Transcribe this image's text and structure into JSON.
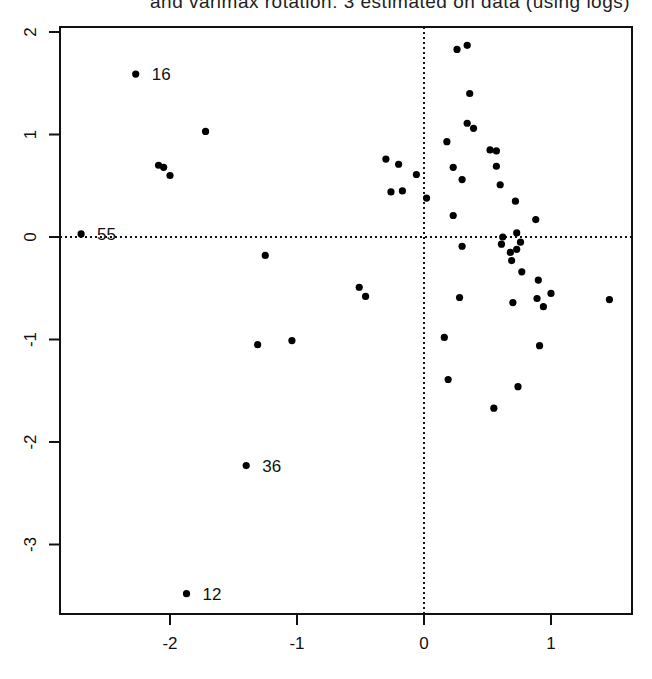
{
  "caption": "and varimax rotation: 3 estimated on data (using logs)",
  "chart_data": {
    "type": "scatter",
    "title": "and varimax rotation: 3 estimated on data (using logs)",
    "xlabel": "",
    "ylabel": "",
    "xlim": [
      -2.8,
      1.64
    ],
    "ylim": [
      -3.68,
      2.05
    ],
    "grid": false,
    "reference_lines": {
      "x": 0,
      "y": 0,
      "style": "dotted"
    },
    "x_ticks": [
      -2,
      -1,
      0,
      1
    ],
    "x_tick_labels": [
      "-2",
      "-1",
      "0",
      "1"
    ],
    "y_ticks": [
      2,
      1,
      0,
      -1,
      -2,
      -3
    ],
    "y_tick_labels": [
      "2",
      "1",
      "0",
      "-1",
      "-2",
      "-3"
    ],
    "labeled_points": [
      {
        "label": "16",
        "x": -2.27,
        "y": 1.59
      },
      {
        "label": "55",
        "x": -2.7,
        "y": 0.03
      },
      {
        "label": "36",
        "x": -1.4,
        "y": -2.23
      },
      {
        "label": "12",
        "x": -1.87,
        "y": -3.48
      }
    ],
    "points": [
      {
        "x": -2.27,
        "y": 1.59
      },
      {
        "x": -1.72,
        "y": 1.03
      },
      {
        "x": -2.09,
        "y": 0.7
      },
      {
        "x": -2.05,
        "y": 0.68
      },
      {
        "x": -2.0,
        "y": 0.6
      },
      {
        "x": -2.7,
        "y": 0.03
      },
      {
        "x": -1.25,
        "y": -0.18
      },
      {
        "x": -0.51,
        "y": -0.49
      },
      {
        "x": -0.46,
        "y": -0.58
      },
      {
        "x": -1.31,
        "y": -1.05
      },
      {
        "x": -1.04,
        "y": -1.01
      },
      {
        "x": -1.4,
        "y": -2.23
      },
      {
        "x": -1.87,
        "y": -3.48
      },
      {
        "x": -0.3,
        "y": 0.76
      },
      {
        "x": -0.2,
        "y": 0.71
      },
      {
        "x": -0.06,
        "y": 0.61
      },
      {
        "x": -0.26,
        "y": 0.44
      },
      {
        "x": -0.17,
        "y": 0.45
      },
      {
        "x": 0.02,
        "y": 0.38
      },
      {
        "x": 0.26,
        "y": 1.83
      },
      {
        "x": 0.34,
        "y": 1.87
      },
      {
        "x": 0.36,
        "y": 1.4
      },
      {
        "x": 0.34,
        "y": 1.11
      },
      {
        "x": 0.39,
        "y": 1.06
      },
      {
        "x": 0.18,
        "y": 0.93
      },
      {
        "x": 0.52,
        "y": 0.85
      },
      {
        "x": 0.57,
        "y": 0.84
      },
      {
        "x": 0.23,
        "y": 0.68
      },
      {
        "x": 0.57,
        "y": 0.69
      },
      {
        "x": 0.3,
        "y": 0.56
      },
      {
        "x": 0.6,
        "y": 0.51
      },
      {
        "x": 0.72,
        "y": 0.35
      },
      {
        "x": 0.23,
        "y": 0.21
      },
      {
        "x": 0.88,
        "y": 0.17
      },
      {
        "x": 0.73,
        "y": 0.04
      },
      {
        "x": 0.62,
        "y": 0.0
      },
      {
        "x": 0.3,
        "y": -0.09
      },
      {
        "x": 0.61,
        "y": -0.07
      },
      {
        "x": 0.76,
        "y": -0.05
      },
      {
        "x": 0.68,
        "y": -0.15
      },
      {
        "x": 0.73,
        "y": -0.12
      },
      {
        "x": 0.69,
        "y": -0.23
      },
      {
        "x": 0.77,
        "y": -0.34
      },
      {
        "x": 0.9,
        "y": -0.42
      },
      {
        "x": 1.0,
        "y": -0.55
      },
      {
        "x": 0.28,
        "y": -0.59
      },
      {
        "x": 0.89,
        "y": -0.6
      },
      {
        "x": 0.7,
        "y": -0.64
      },
      {
        "x": 0.94,
        "y": -0.68
      },
      {
        "x": 1.46,
        "y": -0.61
      },
      {
        "x": 0.16,
        "y": -0.98
      },
      {
        "x": 0.91,
        "y": -1.06
      },
      {
        "x": 0.19,
        "y": -1.39
      },
      {
        "x": 0.74,
        "y": -1.46
      },
      {
        "x": 0.55,
        "y": -1.67
      }
    ]
  }
}
